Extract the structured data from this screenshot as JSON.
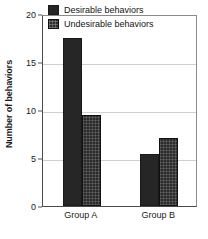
{
  "chart_data": {
    "type": "bar",
    "title": "",
    "subtitle": "",
    "xlabel": "",
    "ylabel": "Number of behaviors",
    "categories": [
      "Group A",
      "Group B"
    ],
    "series": [
      {
        "name": "Desirable behaviors",
        "values": [
          17.5,
          5.4
        ],
        "color": "#262626",
        "pattern": "solid"
      },
      {
        "name": "Undesirable behaviors",
        "values": [
          9.5,
          7.1
        ],
        "color": "#2b2b2b",
        "pattern": "textured"
      }
    ],
    "ylim": [
      0,
      20
    ],
    "yticks": [
      0,
      5,
      10,
      15,
      20
    ],
    "ytick_labels": [
      "0",
      "5",
      "10",
      "15",
      "20"
    ],
    "grid": true,
    "grid_axis": "y",
    "legend_position": "top-center-inside",
    "frame": true,
    "background_color": "#ffffff",
    "grid_color": "#cfcfcf",
    "axis_color": "#4a4a4a"
  },
  "legend": {
    "items": [
      {
        "label": "Desirable behaviors"
      },
      {
        "label": "Undesirable behaviors"
      }
    ]
  },
  "axes": {
    "y_title": "Number of behaviors",
    "y_tick_0": "0",
    "y_tick_1": "5",
    "y_tick_2": "10",
    "y_tick_3": "15",
    "y_tick_4": "20",
    "x_tick_0": "Group A",
    "x_tick_1": "Group B"
  }
}
